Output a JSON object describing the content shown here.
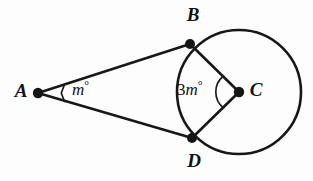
{
  "figure": {
    "background_color": "#fdfdfd",
    "stroke_color": "#171717"
  },
  "points": {
    "a": {
      "name": "A",
      "label": "A",
      "x": 38,
      "y": 93,
      "label_x": 21,
      "label_y": 93,
      "dot_r": 5.2,
      "on_circle": false,
      "role": "external-point"
    },
    "b": {
      "name": "B",
      "label": "B",
      "x": 190,
      "y": 44,
      "label_x": 193,
      "label_y": 17,
      "dot_r": 5.0,
      "on_circle": true,
      "role": "tangent-point"
    },
    "c": {
      "name": "C",
      "label": "C",
      "x": 239,
      "y": 92,
      "label_x": 256,
      "label_y": 92,
      "dot_r": 5.2,
      "on_circle": false,
      "role": "center"
    },
    "d": {
      "name": "D",
      "label": "D",
      "x": 192,
      "y": 138,
      "label_x": 194,
      "label_y": 163,
      "dot_r": 5.0,
      "on_circle": true,
      "role": "tangent-point"
    }
  },
  "circle": {
    "name": "main-circle",
    "center_x": 239,
    "center_y": 92,
    "radius": 62,
    "stroke_width": 2.6
  },
  "segments": [
    {
      "name": "segment-ab",
      "from": "A",
      "to": "B",
      "x1": 38,
      "y1": 93,
      "x2": 190,
      "y2": 44,
      "stroke_width": 2.6
    },
    {
      "name": "segment-ad",
      "from": "A",
      "to": "D",
      "x1": 38,
      "y1": 93,
      "x2": 192,
      "y2": 138,
      "stroke_width": 2.6
    },
    {
      "name": "segment-bc",
      "from": "B",
      "to": "C",
      "x1": 190,
      "y1": 44,
      "x2": 239,
      "y2": 92,
      "stroke_width": 2.6
    },
    {
      "name": "segment-dc",
      "from": "D",
      "to": "C",
      "x1": 192,
      "y1": 138,
      "x2": 239,
      "y2": 92,
      "stroke_width": 2.6
    }
  ],
  "angles": {
    "at_a": {
      "name": "angle-a",
      "vertex": "A",
      "text_full": "m°",
      "coefficient": "",
      "variable": "m",
      "degree_symbol": "°",
      "text_x": 72,
      "text_y": 91,
      "arc": {
        "d": "M 64 85 L 61.5 93 L 64 101",
        "description": "small-angle-tick-at-A"
      }
    },
    "at_c": {
      "name": "angle-c",
      "vertex": "C",
      "text_full": "3m°",
      "coefficient": "3",
      "variable": "m",
      "degree_symbol": "°",
      "text_x": 177,
      "text_y": 91,
      "arc": {
        "d": "M 223 76 A 20 20 0 0 0 223 108",
        "description": "angle-arc-at-C"
      }
    }
  },
  "measurements": {
    "angle_a_expression": "m°",
    "angle_c_expression": "3m°"
  }
}
